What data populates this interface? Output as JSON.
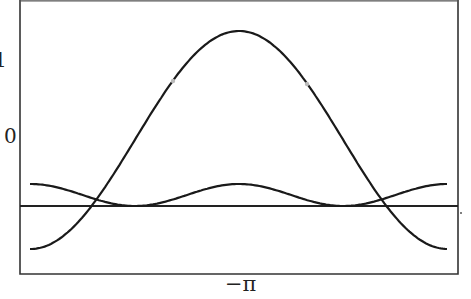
{
  "chart_data": {
    "type": "line",
    "title": "",
    "xlabel": "",
    "ylabel": "",
    "x_tick_labels": [
      "−π"
    ],
    "y_tick_labels": [
      "1",
      "0"
    ],
    "xlim": [
      -1.0,
      1.0
    ],
    "ylim": [
      -0.55,
      1.25
    ],
    "grid": false,
    "legend": null,
    "series": [
      {
        "name": "large bump (1+cos)/2 shifted",
        "x": [
          -1.0,
          -0.75,
          -0.5,
          -0.25,
          0.0,
          0.25,
          0.5,
          0.75,
          1.0
        ],
        "values": [
          -0.3,
          -0.15,
          0.35,
          0.85,
          1.0,
          0.85,
          0.35,
          -0.15,
          -0.3
        ]
      },
      {
        "name": "small ripple",
        "x": [
          -1.0,
          -0.5,
          0.0,
          0.5,
          1.0
        ],
        "values": [
          0.15,
          0.0,
          0.15,
          0.0,
          0.15
        ]
      },
      {
        "name": "baseline",
        "x": [
          -1.0,
          1.0
        ],
        "values": [
          0.0,
          0.0
        ]
      }
    ],
    "annotations": [
      "gray dots on large curve near half-height"
    ]
  },
  "labels": {
    "y_top": "1",
    "y_zero": "0",
    "x_center": "−π"
  }
}
